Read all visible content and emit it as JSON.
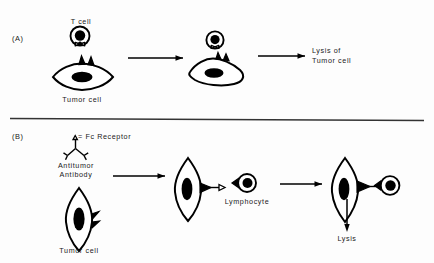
{
  "figure": {
    "background_color": "#fdfdfd",
    "ink_color": "#000000",
    "divider_color": "#333333"
  },
  "panels": [
    {
      "id": "panel-a",
      "label": "(A)",
      "caption": "T cell mediated cytotoxicity",
      "labels": {
        "effector": "T cell",
        "target": "Tumor cell",
        "outcome_line1": "Lysis of",
        "outcome_line2": "Tumor cell"
      },
      "arrows": [
        {
          "name": "arrow-a-1",
          "from_stage": "recognition",
          "to_stage": "conjugate"
        },
        {
          "name": "arrow-a-2",
          "from_stage": "conjugate",
          "to_stage": "lysis"
        }
      ]
    },
    {
      "id": "panel-b",
      "label": "(B)",
      "caption": "Antibody dependent cell mediated cytotoxicity",
      "labels": {
        "fc_receptor": "= Fc Receptor",
        "fc_receptor_symbol": "triangle",
        "antibody_line1": "Antitumor",
        "antibody_line2": "Antibody",
        "target": "Tumor cell",
        "effector": "Lymphocyte",
        "outcome": "Lysis"
      },
      "arrows": [
        {
          "name": "arrow-b-1",
          "from_stage": "antibody-coating",
          "to_stage": "opsonized-tumor"
        },
        {
          "name": "arrow-b-2",
          "from_stage": "opsonized-tumor",
          "to_stage": "conjugate"
        },
        {
          "name": "arrow-b-3",
          "from_stage": "conjugate",
          "to_stage": "lysis"
        }
      ]
    }
  ]
}
